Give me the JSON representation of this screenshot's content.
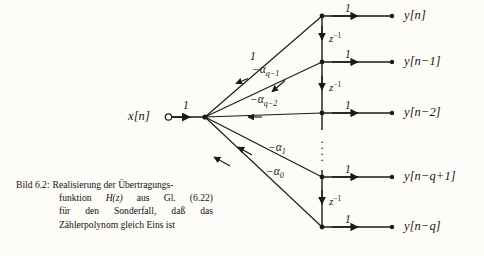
{
  "figure": {
    "background_color": "#fdfcf8",
    "line_color": "#1a1a1a",
    "input": {
      "label": "x[n]",
      "gain": "1"
    },
    "sum_node": {
      "name": "summing-junction"
    },
    "branches": [
      {
        "id": "b-top",
        "label": "1",
        "sub": "",
        "target_row": 0
      },
      {
        "id": "b-aq1",
        "label": "−α",
        "sub": "q−1",
        "target_row": 1
      },
      {
        "id": "b-aq2",
        "label": "−α",
        "sub": "q−2",
        "target_row": 2
      },
      {
        "id": "b-a1",
        "label": "−α",
        "sub": "1",
        "target_row": 3
      },
      {
        "id": "b-a0",
        "label": "−α",
        "sub": "0",
        "target_row": 4
      }
    ],
    "delays": [
      {
        "id": "d1",
        "label": "z",
        "exp": "−1"
      },
      {
        "id": "d2",
        "label": "z",
        "exp": "−1"
      },
      {
        "id": "d3",
        "label": "z",
        "exp": "−1"
      }
    ],
    "vertical_ellipsis": "⋮",
    "outputs": [
      {
        "id": "o0",
        "gain": "1",
        "label": "y[n]"
      },
      {
        "id": "o1",
        "gain": "1",
        "label": "y[n−1]"
      },
      {
        "id": "o2",
        "gain": "1",
        "label": "y[n−2]"
      },
      {
        "id": "o3",
        "gain": "1",
        "label": "y[n−q+1]"
      },
      {
        "id": "o4",
        "gain": "1",
        "label": "y[n−q]"
      }
    ]
  },
  "caption": {
    "head": "Bild 6.2:",
    "line1": "Realisierung der Übertragungs-",
    "line2_a": "funktion",
    "line2_b": "H(z)",
    "line2_c": "aus",
    "line2_d": "Gl.",
    "line2_e": "(6.22)",
    "line3_a": "für",
    "line3_b": "den",
    "line3_c": "Sonderfall,",
    "line3_d": "daß",
    "line3_e": "das",
    "line4": "Zählerpolynom gleich Eins ist"
  }
}
